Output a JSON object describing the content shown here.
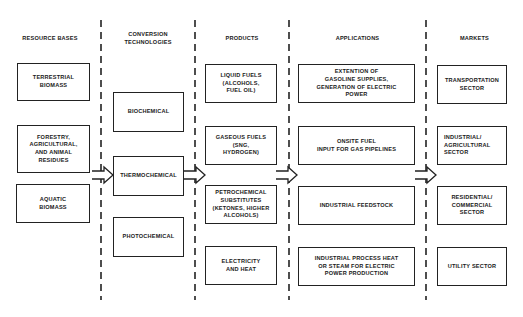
{
  "columns": [
    {
      "header": "RESOURCE BASES",
      "boxes": [
        "TERRESTRIAL\nBIOMASS",
        "FORESTRY,\nAGRICULTURAL,\nAND ANIMAL\nRESIDUES",
        "AQUATIC\nBIOMASS"
      ]
    },
    {
      "header": "CONVERSION\nTECHNOLOGIES",
      "boxes": [
        "BIOCHEMICAL",
        "THERMOCHEMICAL",
        "PHOTOCHEMICAL"
      ]
    },
    {
      "header": "PRODUCTS",
      "boxes": [
        "LIQUID FUELS\n(ALCOHOLS,\nFUEL OIL)",
        "GASEOUS FUELS\n(SNG,\nHYDROGEN)",
        "PETROCHEMICAL\nSUBSTITUTES\n(KETONES, HIGHER\nALCOHOLS)",
        "ELECTRICITY\nAND HEAT"
      ]
    },
    {
      "header": "APPLICATIONS",
      "boxes": [
        "EXTENTION OF\nGASOLINE SUPPLIES,\nGENERATION OF ELECTRIC\nPOWER",
        "ONSITE FUEL\nINPUT FOR GAS PIPELINES",
        "INDUSTRIAL FEEDSTOCK",
        "INDUSTRIAL PROCESS HEAT\nOR STEAM FOR ELECTRIC\nPOWER PRODUCTION"
      ]
    },
    {
      "header": "MARKETS",
      "boxes": [
        "TRANSPORTATION\nSECTOR",
        "INDUSTRIAL/\nAGRICULTURAL\nSECTOR",
        "RESIDENTIAL/\nCOMMERCIAL\nSECTOR",
        "UTILITY SECTOR"
      ]
    }
  ],
  "flow": [
    {
      "from": "resource-bases",
      "to": "conversion-technologies"
    },
    {
      "from": "conversion-technologies",
      "to": "products"
    },
    {
      "from": "products",
      "to": "applications"
    },
    {
      "from": "applications",
      "to": "markets"
    }
  ],
  "colors": {
    "line": "#222222",
    "background": "#ffffff"
  }
}
